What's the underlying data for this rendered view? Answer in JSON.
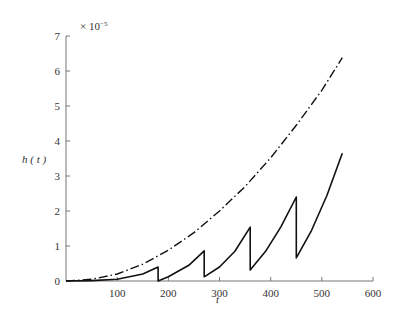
{
  "chart_data": {
    "type": "line",
    "title": "",
    "xlabel": "t",
    "ylabel": "h ( t )",
    "y_scale_note": "× 10⁻⁵",
    "xlim": [
      0,
      600
    ],
    "ylim": [
      0,
      7
    ],
    "x_ticks": [
      100,
      200,
      300,
      400,
      500,
      600
    ],
    "y_ticks": [
      0,
      1,
      2,
      3,
      4,
      5,
      6,
      7
    ],
    "grid": false,
    "legend": null,
    "series": [
      {
        "name": "envelope (dash-dot)",
        "style": "dash-dot",
        "x": [
          0,
          50,
          100,
          150,
          180,
          200,
          250,
          300,
          350,
          400,
          450,
          500,
          540
        ],
        "y": [
          0,
          0.05,
          0.2,
          0.48,
          0.72,
          0.88,
          1.38,
          2.0,
          2.7,
          3.52,
          4.45,
          5.45,
          6.38
        ]
      },
      {
        "name": "sawtooth (solid)",
        "style": "solid",
        "x": [
          0,
          50,
          100,
          150,
          180,
          180,
          200,
          240,
          270,
          270,
          300,
          330,
          360,
          360,
          390,
          420,
          450,
          450,
          480,
          510,
          540
        ],
        "y": [
          0,
          0.01,
          0.05,
          0.2,
          0.4,
          0.0,
          0.12,
          0.45,
          0.86,
          0.12,
          0.4,
          0.85,
          1.54,
          0.31,
          0.85,
          1.55,
          2.4,
          0.66,
          1.45,
          2.45,
          3.65
        ]
      }
    ],
    "resets_at": [
      180,
      270,
      360,
      450
    ]
  },
  "labels": {
    "ylabel": "h ( t )",
    "xlabel": "t",
    "exponent": "× 10",
    "exponent_power": "−5"
  }
}
